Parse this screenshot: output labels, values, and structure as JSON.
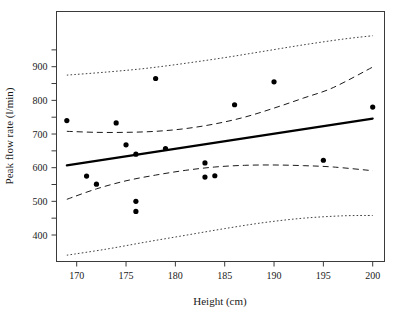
{
  "chart_data": {
    "type": "scatter",
    "title": "",
    "xlabel": "Height (cm)",
    "ylabel": "Peak flow rate (l/min)",
    "xlim": [
      168.0,
      201.3
    ],
    "ylim": [
      318.0,
      992.0
    ],
    "grid": false,
    "legend": "none",
    "xticks": [
      170,
      175,
      180,
      185,
      190,
      195,
      200
    ],
    "xtick_labels": [
      "170",
      "175",
      "180",
      "185",
      "190",
      "195",
      "200"
    ],
    "yticks": [
      400,
      450,
      500,
      550,
      600,
      650,
      700,
      750,
      800,
      850,
      900,
      950
    ],
    "ytick_labels_shown": [
      "400",
      "500",
      "600",
      "700",
      "800",
      "900"
    ],
    "ylabeled_ticks": [
      400,
      500,
      600,
      700,
      800,
      900
    ],
    "points": [
      {
        "x": 169,
        "y": 740
      },
      {
        "x": 171,
        "y": 575
      },
      {
        "x": 172,
        "y": 551
      },
      {
        "x": 174,
        "y": 733
      },
      {
        "x": 175,
        "y": 668
      },
      {
        "x": 176,
        "y": 640
      },
      {
        "x": 176,
        "y": 500
      },
      {
        "x": 176,
        "y": 470
      },
      {
        "x": 178,
        "y": 865
      },
      {
        "x": 179,
        "y": 657
      },
      {
        "x": 183,
        "y": 614
      },
      {
        "x": 183,
        "y": 572
      },
      {
        "x": 184,
        "y": 576
      },
      {
        "x": 186,
        "y": 787
      },
      {
        "x": 190,
        "y": 855
      },
      {
        "x": 195,
        "y": 622
      },
      {
        "x": 200,
        "y": 780
      }
    ],
    "series": [
      {
        "name": "regression-line",
        "style": "solid",
        "points": [
          {
            "x": 169,
            "y": 607
          },
          {
            "x": 200,
            "y": 746
          }
        ]
      },
      {
        "name": "confidence-band-upper",
        "style": "dashed",
        "points": [
          {
            "x": 169,
            "y": 708
          },
          {
            "x": 172,
            "y": 705
          },
          {
            "x": 175,
            "y": 705
          },
          {
            "x": 178,
            "y": 708
          },
          {
            "x": 181,
            "y": 716
          },
          {
            "x": 184,
            "y": 730
          },
          {
            "x": 187,
            "y": 750
          },
          {
            "x": 190,
            "y": 777
          },
          {
            "x": 193,
            "y": 807
          },
          {
            "x": 196,
            "y": 838
          },
          {
            "x": 200,
            "y": 899
          }
        ]
      },
      {
        "name": "confidence-band-lower",
        "style": "dashed",
        "points": [
          {
            "x": 169,
            "y": 506
          },
          {
            "x": 172,
            "y": 537
          },
          {
            "x": 175,
            "y": 561
          },
          {
            "x": 178,
            "y": 578
          },
          {
            "x": 181,
            "y": 592
          },
          {
            "x": 184,
            "y": 602
          },
          {
            "x": 187,
            "y": 607
          },
          {
            "x": 190,
            "y": 608
          },
          {
            "x": 193,
            "y": 606
          },
          {
            "x": 196,
            "y": 602
          },
          {
            "x": 200,
            "y": 591
          }
        ]
      },
      {
        "name": "prediction-band-upper",
        "style": "dotted",
        "points": [
          {
            "x": 169,
            "y": 875
          },
          {
            "x": 173,
            "y": 884
          },
          {
            "x": 177,
            "y": 895
          },
          {
            "x": 181,
            "y": 910
          },
          {
            "x": 185,
            "y": 927
          },
          {
            "x": 189,
            "y": 946
          },
          {
            "x": 193,
            "y": 965
          },
          {
            "x": 197,
            "y": 982
          },
          {
            "x": 200,
            "y": 992
          }
        ]
      },
      {
        "name": "prediction-band-lower",
        "style": "dotted",
        "points": [
          {
            "x": 169,
            "y": 340
          },
          {
            "x": 173,
            "y": 358
          },
          {
            "x": 177,
            "y": 379
          },
          {
            "x": 181,
            "y": 399
          },
          {
            "x": 185,
            "y": 419
          },
          {
            "x": 189,
            "y": 437
          },
          {
            "x": 193,
            "y": 450
          },
          {
            "x": 197,
            "y": 457
          },
          {
            "x": 200,
            "y": 458
          }
        ]
      }
    ]
  },
  "colors": {
    "axis": "#3a3a3a",
    "text": "#1a1a1a",
    "point": "#000000",
    "fit": "#000000",
    "background": "#ffffff"
  }
}
